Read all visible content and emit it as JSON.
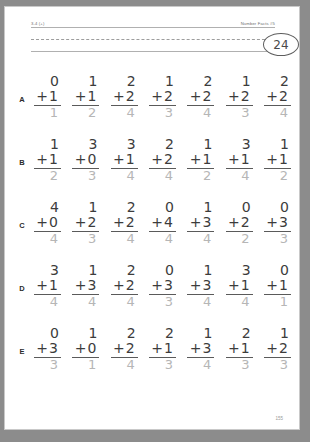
{
  "page": {
    "header_left": "3-4 (+)",
    "header_right": "Number Facts #5",
    "badge": "24",
    "footer_page_number": "155"
  },
  "rows": [
    {
      "label": "A",
      "problems": [
        {
          "top": "0",
          "operator": "+",
          "bottom": "1",
          "answer": "1"
        },
        {
          "top": "1",
          "operator": "+",
          "bottom": "1",
          "answer": "2"
        },
        {
          "top": "2",
          "operator": "+",
          "bottom": "2",
          "answer": "4"
        },
        {
          "top": "1",
          "operator": "+",
          "bottom": "2",
          "answer": "3"
        },
        {
          "top": "2",
          "operator": "+",
          "bottom": "2",
          "answer": "4"
        },
        {
          "top": "1",
          "operator": "+",
          "bottom": "2",
          "answer": "3"
        },
        {
          "top": "2",
          "operator": "+",
          "bottom": "2",
          "answer": "4"
        }
      ]
    },
    {
      "label": "B",
      "problems": [
        {
          "top": "1",
          "operator": "+",
          "bottom": "1",
          "answer": "2"
        },
        {
          "top": "3",
          "operator": "+",
          "bottom": "0",
          "answer": "3"
        },
        {
          "top": "3",
          "operator": "+",
          "bottom": "1",
          "answer": "4"
        },
        {
          "top": "2",
          "operator": "+",
          "bottom": "2",
          "answer": "4"
        },
        {
          "top": "1",
          "operator": "+",
          "bottom": "1",
          "answer": "2"
        },
        {
          "top": "3",
          "operator": "+",
          "bottom": "1",
          "answer": "4"
        },
        {
          "top": "1",
          "operator": "+",
          "bottom": "1",
          "answer": "2"
        }
      ]
    },
    {
      "label": "C",
      "problems": [
        {
          "top": "4",
          "operator": "+",
          "bottom": "0",
          "answer": "4"
        },
        {
          "top": "1",
          "operator": "+",
          "bottom": "2",
          "answer": "3"
        },
        {
          "top": "2",
          "operator": "+",
          "bottom": "2",
          "answer": "4"
        },
        {
          "top": "0",
          "operator": "+",
          "bottom": "4",
          "answer": "4"
        },
        {
          "top": "1",
          "operator": "+",
          "bottom": "3",
          "answer": "4"
        },
        {
          "top": "0",
          "operator": "+",
          "bottom": "2",
          "answer": "2"
        },
        {
          "top": "0",
          "operator": "+",
          "bottom": "3",
          "answer": "3"
        }
      ]
    },
    {
      "label": "D",
      "problems": [
        {
          "top": "3",
          "operator": "+",
          "bottom": "1",
          "answer": "4"
        },
        {
          "top": "1",
          "operator": "+",
          "bottom": "3",
          "answer": "4"
        },
        {
          "top": "2",
          "operator": "+",
          "bottom": "2",
          "answer": "4"
        },
        {
          "top": "0",
          "operator": "+",
          "bottom": "3",
          "answer": "3"
        },
        {
          "top": "1",
          "operator": "+",
          "bottom": "3",
          "answer": "4"
        },
        {
          "top": "3",
          "operator": "+",
          "bottom": "1",
          "answer": "4"
        },
        {
          "top": "0",
          "operator": "+",
          "bottom": "1",
          "answer": "1"
        }
      ]
    },
    {
      "label": "E",
      "problems": [
        {
          "top": "0",
          "operator": "+",
          "bottom": "3",
          "answer": "3"
        },
        {
          "top": "1",
          "operator": "+",
          "bottom": "0",
          "answer": "1"
        },
        {
          "top": "2",
          "operator": "+",
          "bottom": "2",
          "answer": "4"
        },
        {
          "top": "2",
          "operator": "+",
          "bottom": "1",
          "answer": "3"
        },
        {
          "top": "1",
          "operator": "+",
          "bottom": "3",
          "answer": "4"
        },
        {
          "top": "2",
          "operator": "+",
          "bottom": "1",
          "answer": "3"
        },
        {
          "top": "1",
          "operator": "+",
          "bottom": "2",
          "answer": "3"
        }
      ]
    }
  ]
}
